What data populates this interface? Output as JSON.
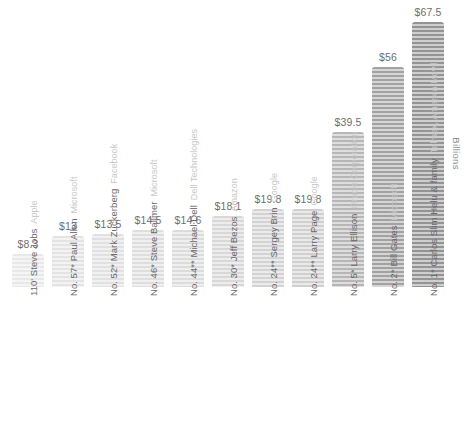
{
  "axis": {
    "unit_label": "Billions"
  },
  "chart_data": {
    "type": "bar",
    "title": "",
    "xlabel": "",
    "ylabel": "Billions",
    "ylim": [
      0,
      67.5
    ],
    "grid": false,
    "legend": false,
    "value_prefix": "$",
    "categories": [
      "110' Steve Jobs",
      "No. 57* Paul Allen",
      "No. 52* Mark Zuckerberg",
      "No. 46* Steve Ballmer",
      "No. 44** Michael Dell",
      "No. 30* Jeff Bezos",
      "No. 24** Sergey Brin",
      "No. 24** Larry Page",
      "No. 5* Larry Ellison",
      "No. 2* Bill Gates",
      "No. 1* Carlos Slim Helu & family"
    ],
    "companies": [
      "Apple",
      "Microsoft",
      "Facebook",
      "Microsoft",
      "Dell Technologies",
      "Amazon",
      "Google",
      "Google",
      "Oracle Corporation",
      "Microsoft",
      "Telmex, America Movil"
    ],
    "values": [
      8.3,
      13,
      13.5,
      14.5,
      14.6,
      18.1,
      19.8,
      19.8,
      39.5,
      56,
      67.5
    ],
    "value_labels": [
      "$8.3",
      "$13",
      "$13.5",
      "$14.5",
      "$14.6",
      "$18.1",
      "$19.8",
      "$19.8",
      "$39.5",
      "$56",
      "$67.5"
    ],
    "bar_colors": [
      "#e8e8e8",
      "#e4e4e4",
      "#e1e1e1",
      "#dedede",
      "#dcdcdc",
      "#d8d8d8",
      "#d3d3d3",
      "#d0d0d0",
      "#b6b6b6",
      "#a2a2a2",
      "#949494"
    ],
    "colors": {
      "value_text": "#6e6e6e",
      "label_text": "#6a6a6a",
      "company_text": "#c8c8c8",
      "background": "#ffffff"
    }
  }
}
